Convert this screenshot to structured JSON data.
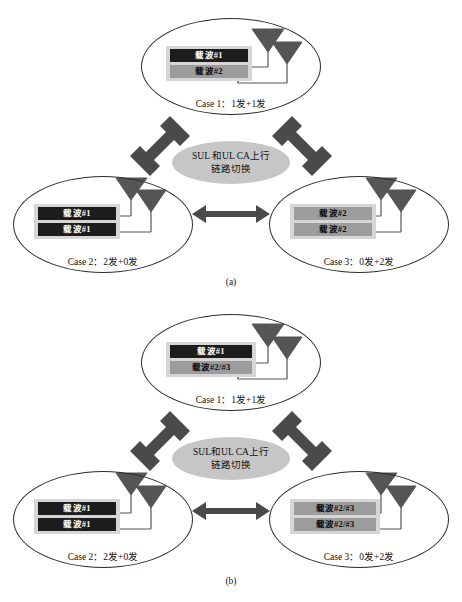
{
  "figure": {
    "panels": [
      {
        "caption": "(a)",
        "hub": {
          "line1": "SUL 和UL CA上行",
          "line2": "链路切换"
        },
        "cases": [
          {
            "id": "case1",
            "label": "Case 1：1发+1发",
            "bars": [
              {
                "text": "载波#1",
                "style": "dark"
              },
              {
                "text": "载波#2",
                "style": "gray"
              }
            ],
            "antennas": 2
          },
          {
            "id": "case2",
            "label": "Case 2：2发+0发",
            "bars": [
              {
                "text": "载波#1",
                "style": "dark"
              },
              {
                "text": "载波#1",
                "style": "dark"
              }
            ],
            "antennas": 2
          },
          {
            "id": "case3",
            "label": "Case 3：0发+2发",
            "bars": [
              {
                "text": "载波#2",
                "style": "gray"
              },
              {
                "text": "载波#2",
                "style": "gray"
              }
            ],
            "antennas": 2
          }
        ]
      },
      {
        "caption": "(b)",
        "hub": {
          "line1": "SUL和UL CA上行",
          "line2": "链路切换"
        },
        "cases": [
          {
            "id": "case1",
            "label": "Case 1：1发+1发",
            "bars": [
              {
                "text": "载波#1",
                "style": "dark"
              },
              {
                "text": "载波#2/#3",
                "style": "gray"
              }
            ],
            "antennas": 2
          },
          {
            "id": "case2",
            "label": "Case 2：2发+0发",
            "bars": [
              {
                "text": "载波#1",
                "style": "dark"
              },
              {
                "text": "载波#1",
                "style": "dark"
              }
            ],
            "antennas": 2
          },
          {
            "id": "case3",
            "label": "Case 3：0发+2发",
            "bars": [
              {
                "text": "载波#2/#3",
                "style": "gray"
              },
              {
                "text": "载波#2/#3",
                "style": "gray"
              }
            ],
            "antennas": 2
          }
        ]
      }
    ],
    "colors": {
      "bar_dark": "#1c1c1c",
      "bar_gray": "#9c9c9c",
      "bar_panel": "#d6d6d6",
      "hub_fill": "#c6c6c6",
      "arrow": "#4a4a4a",
      "antenna": "#555555",
      "outline": "#2b2b2b"
    }
  }
}
